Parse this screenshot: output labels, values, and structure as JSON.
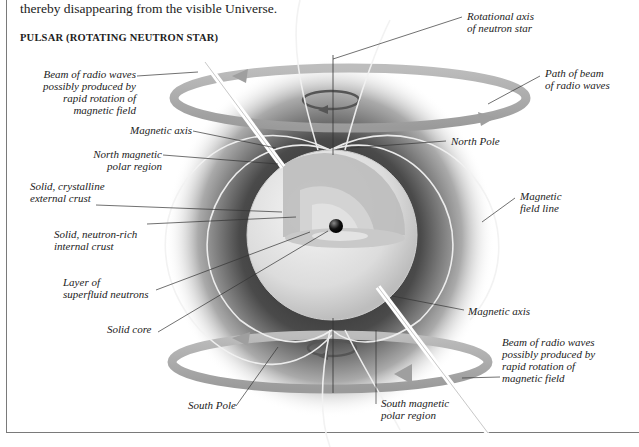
{
  "intro_text": "thereby disappearing from the visible Universe.",
  "heading": "PULSAR (ROTATING NEUTRON STAR)",
  "labels": {
    "beam_top": "Beam of radio waves\npossibly produced by\nrapid rotation of\nmagnetic field",
    "magnetic_axis_top": "Magnetic axis",
    "north_magnetic_polar_region": "North magnetic\npolar region",
    "solid_crystalline_crust": "Solid, crystalline\nexternal crust",
    "solid_neutron_rich_crust": "Solid, neutron-rich\ninternal crust",
    "superfluid_layer": "Layer of\nsuperfluid neutrons",
    "solid_core": "Solid core",
    "rotational_axis": "Rotational axis\nof neutron star",
    "path_of_beam": "Path of beam\nof radio waves",
    "north_pole": "North Pole",
    "magnetic_field_line": "Magnetic\nfield line",
    "magnetic_axis_bottom": "Magnetic axis",
    "beam_bottom": "Beam of radio waves\npossibly produced by\nrapid rotation of\nmagnetic field",
    "south_pole": "South Pole",
    "south_magnetic_polar_region": "South magnetic\npolar region"
  },
  "colors": {
    "ring": "#a9a9a9",
    "halo": "#3a3a3a",
    "star_surface": "#e6e6e6",
    "core": "#111111",
    "text": "#222222"
  }
}
